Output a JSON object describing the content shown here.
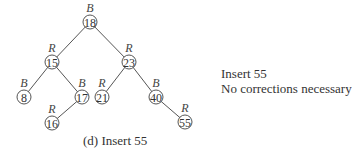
{
  "tree": {
    "nodes": [
      {
        "key": "18",
        "color": "B",
        "x": 90,
        "y": 22
      },
      {
        "key": "15",
        "color": "R",
        "x": 52,
        "y": 62
      },
      {
        "key": "23",
        "color": "R",
        "x": 129,
        "y": 62
      },
      {
        "key": "8",
        "color": "B",
        "x": 24,
        "y": 97
      },
      {
        "key": "17",
        "color": "B",
        "x": 82,
        "y": 97
      },
      {
        "key": "21",
        "color": "R",
        "x": 102,
        "y": 97
      },
      {
        "key": "40",
        "color": "B",
        "x": 156,
        "y": 97
      },
      {
        "key": "16",
        "color": "R",
        "x": 52,
        "y": 123
      },
      {
        "key": "55",
        "color": "R",
        "x": 185,
        "y": 122
      }
    ],
    "edges": [
      [
        0,
        1
      ],
      [
        0,
        2
      ],
      [
        1,
        3
      ],
      [
        1,
        4
      ],
      [
        2,
        5
      ],
      [
        2,
        6
      ],
      [
        4,
        7
      ],
      [
        6,
        8
      ]
    ]
  },
  "side_note": {
    "line1": "Insert 55",
    "line2": "No corrections necessary"
  },
  "caption": "(d) Insert 55"
}
